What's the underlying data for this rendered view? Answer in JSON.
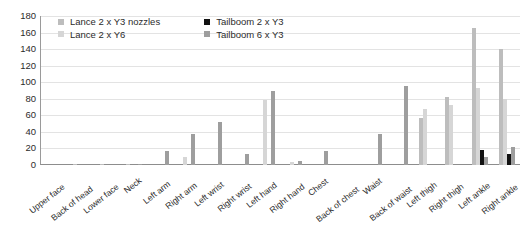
{
  "chart_data": {
    "type": "bar",
    "title": "",
    "xlabel": "",
    "ylabel": "",
    "ylim": [
      0,
      180
    ],
    "ytick_step": 20,
    "yticks": [
      180,
      160,
      140,
      120,
      100,
      80,
      60,
      40,
      20,
      0
    ],
    "grid": "horizontal",
    "legend_position": "top-left-inside",
    "categories": [
      "Upper face",
      "Back of head",
      "Lower face",
      "Neck",
      "Left arm",
      "Right arm",
      "Left wrist",
      "Right wrist",
      "Left hand",
      "Right hand",
      "Chest",
      "Back of chest",
      "Waist",
      "Back of waist",
      "Left thigh",
      "Right thigh",
      "Left ankle",
      "Right ankle"
    ],
    "series": [
      {
        "name": "Lance 2 x Y3 nozzles",
        "color": "#bdbdbd",
        "values": [
          0,
          1,
          1,
          1,
          0,
          0,
          0,
          0,
          0,
          0,
          0,
          0,
          0,
          0,
          57,
          82,
          165,
          140
        ]
      },
      {
        "name": "Lance 2 x Y6",
        "color": "#d6d6d6",
        "values": [
          0,
          0,
          0,
          0,
          0,
          10,
          0,
          0,
          78,
          4,
          0,
          0,
          0,
          0,
          68,
          72,
          93,
          80
        ]
      },
      {
        "name": "Tailboom 2 x Y3",
        "color": "#121212",
        "values": [
          0,
          0,
          0,
          0,
          0,
          0,
          0,
          0,
          0,
          0,
          0,
          0,
          0,
          0,
          0,
          0,
          18,
          13
        ]
      },
      {
        "name": "Tailboom 6 x Y3",
        "color": "#9e9e9e",
        "values": [
          0,
          0,
          0,
          1,
          17,
          38,
          52,
          13,
          90,
          5,
          17,
          0,
          38,
          96,
          0,
          0,
          10,
          22
        ]
      }
    ]
  },
  "legend": {
    "items": [
      {
        "label": "Lance 2 x Y3 nozzles",
        "color": "#bdbdbd"
      },
      {
        "label": "Tailboom 2 x Y3",
        "color": "#121212"
      },
      {
        "label": "Lance 2 x Y6",
        "color": "#d6d6d6"
      },
      {
        "label": "Tailboom 6 x Y3",
        "color": "#9e9e9e"
      }
    ]
  }
}
